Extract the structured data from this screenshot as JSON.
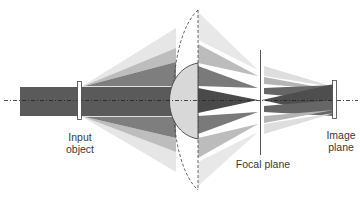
{
  "diagram": {
    "type": "optical-ray-diagram",
    "labels": {
      "input_object": "Input\nobject",
      "focal_plane": "Focal plane",
      "image_plane": "Image\nplane"
    },
    "colors": {
      "beam_dark": "#555555",
      "beam_mid": "#8a8a8a",
      "beam_light": "#b8b8b8",
      "beam_faint": "#dcdcdc",
      "lens_fill": "#d9d9d9",
      "line": "#333333",
      "background": "#ffffff"
    },
    "elements": [
      "optical-axis",
      "input-beam",
      "input-object",
      "outer-lens-outline",
      "inner-half-lens",
      "focal-plane",
      "image-plane"
    ]
  }
}
